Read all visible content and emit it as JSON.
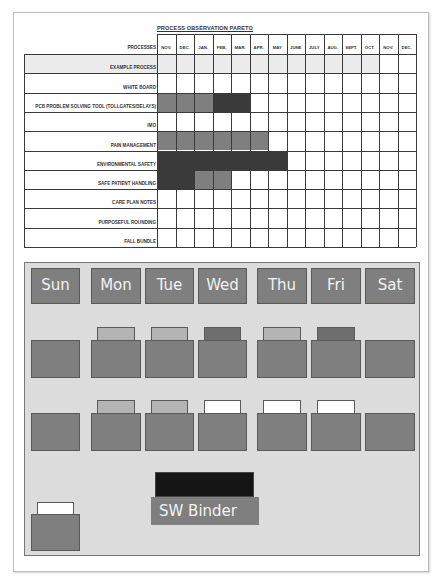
{
  "pareto": {
    "title": "PROCESS OBSERVATION PARETO",
    "header_label": "PROCESSES",
    "months": [
      "NOV.",
      "DEC.",
      "JAN.",
      "FEB.",
      "MAR.",
      "APR.",
      "MAY",
      "JUNE",
      "JULY",
      "AUG.",
      "SEPT.",
      "OCT.",
      "NOV.",
      "DEC."
    ],
    "rows": [
      {
        "label": "EXAMPLE PROCESS",
        "cells": [
          "L",
          "L",
          "L",
          "L",
          "L",
          "L",
          "L",
          "L",
          "L",
          "L",
          "L",
          "L",
          "",
          ""
        ]
      },
      {
        "label": "WHITE BOARD",
        "cells": [
          "",
          "",
          "",
          "",
          "",
          "",
          "",
          "",
          "",
          "",
          "",
          "",
          "",
          ""
        ]
      },
      {
        "label": "PCB PROBLEM SOLVING TOOL (TOLLGATES/DELAYS)",
        "cells": [
          "M",
          "M",
          "M",
          "D",
          "D",
          "",
          "",
          "",
          "",
          "",
          "",
          "",
          "",
          ""
        ]
      },
      {
        "label": "IMO",
        "cells": [
          "",
          "",
          "",
          "",
          "",
          "",
          "",
          "",
          "",
          "",
          "",
          "",
          "",
          ""
        ]
      },
      {
        "label": "PAIN MANAGEMENT",
        "cells": [
          "M",
          "M",
          "M",
          "M",
          "M",
          "M",
          "",
          "",
          "",
          "",
          "",
          "",
          "",
          ""
        ]
      },
      {
        "label": "ENVIRONMENTAL SAFETY",
        "cells": [
          "D",
          "D",
          "D",
          "D",
          "D",
          "D",
          "D",
          "",
          "",
          "",
          "",
          "",
          "",
          ""
        ]
      },
      {
        "label": "SAFE PATIENT HANDLING",
        "cells": [
          "D",
          "D",
          "M",
          "M",
          "",
          "",
          "",
          "",
          "",
          "",
          "",
          "",
          "",
          ""
        ]
      },
      {
        "label": "CARE PLAN NOTES",
        "cells": [
          "",
          "",
          "",
          "",
          "",
          "",
          "",
          "",
          "",
          "",
          "",
          "",
          "",
          ""
        ]
      },
      {
        "label": "PURPOSEFUL ROUNDING",
        "cells": [
          "",
          "",
          "",
          "",
          "",
          "",
          "",
          "",
          "",
          "",
          "",
          "",
          "",
          ""
        ]
      },
      {
        "label": "FALL BUNDLE",
        "cells": [
          "",
          "",
          "",
          "",
          "",
          "",
          "",
          "",
          "",
          "",
          "",
          "",
          "",
          ""
        ]
      }
    ],
    "colors": {
      "L": "#ececec",
      "M": "#7f7f7f",
      "D": "#3a3a3a"
    }
  },
  "board": {
    "days": [
      "Sun",
      "Mon",
      "Tue",
      "Wed",
      "Thu",
      "Fri",
      "Sat"
    ],
    "row1_tabs": [
      "none",
      "light",
      "light",
      "dark",
      "light",
      "dark",
      "none"
    ],
    "row2_tabs": [
      "none",
      "light",
      "light",
      "white",
      "white",
      "white",
      "none"
    ],
    "tab_colors": {
      "light": "#b4b4b4",
      "dark": "#6e6e6e",
      "white": "#ffffff"
    },
    "binder_label": "SW Binder",
    "extra_folder_tab": "white"
  }
}
